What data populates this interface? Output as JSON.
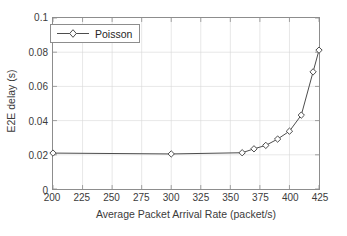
{
  "chart_data": {
    "type": "line",
    "title": "",
    "xlabel": "Average Packet Arrival Rate (packet/s)",
    "ylabel": "E2E delay (s)",
    "xlim": [
      200,
      425
    ],
    "ylim": [
      0,
      0.1
    ],
    "xticks": [
      200,
      225,
      250,
      275,
      300,
      325,
      350,
      375,
      400,
      425
    ],
    "xtick_labels": [
      "200",
      "225",
      "250",
      "275",
      "300",
      "325",
      "350",
      "375",
      "400",
      "425"
    ],
    "yticks": [
      0,
      0.02,
      0.04,
      0.06,
      0.08,
      0.1
    ],
    "ytick_labels": [
      "0",
      "0.02",
      "0.04",
      "0.06",
      "0.08",
      "0.1"
    ],
    "grid": true,
    "legend_position": "top-left",
    "series": [
      {
        "name": "Poisson",
        "color": "#4d4d4d",
        "marker": "diamond",
        "x": [
          200,
          300,
          360,
          370,
          380,
          390,
          400,
          410,
          420,
          425
        ],
        "values": [
          0.021,
          0.0205,
          0.0212,
          0.0235,
          0.0255,
          0.0292,
          0.0338,
          0.0432,
          0.0685,
          0.0812
        ]
      }
    ]
  },
  "legend": {
    "entries": [
      {
        "label": "Poisson"
      }
    ]
  }
}
